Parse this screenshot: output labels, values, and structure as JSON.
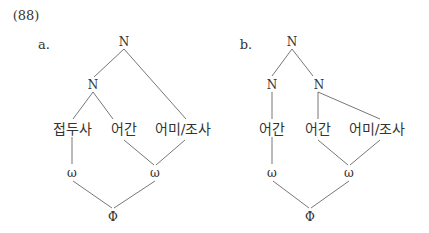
{
  "example_number": "(88)",
  "tree_a": {
    "label": "a.",
    "root": "N",
    "inner_node": "N",
    "leaves": [
      "접두사",
      "어간",
      "어미/조사"
    ],
    "prosodic_words": [
      "ω",
      "ω"
    ],
    "phrase": "Φ"
  },
  "tree_b": {
    "label": "b.",
    "root": "N",
    "left_node": "N",
    "right_node": "N",
    "leaves": [
      "어간",
      "어간",
      "어미/조사"
    ],
    "prosodic_words": [
      "ω",
      "ω"
    ],
    "phrase": "Φ"
  }
}
